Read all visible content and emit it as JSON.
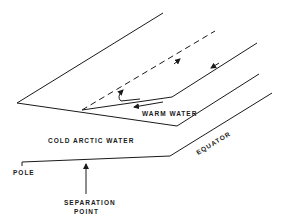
{
  "diagram": {
    "type": "ocean-current-separation-schematic",
    "labels": {
      "warm_water": "WARM WATER",
      "cold_water": "COLD ARCTIC WATER",
      "equator": "EQUATOR",
      "pole": "POLE",
      "separation_line1": "SEPARATION",
      "separation_line2": "POINT"
    },
    "colors": {
      "ink": "#1a1a1a",
      "background": "#ffffff"
    }
  }
}
